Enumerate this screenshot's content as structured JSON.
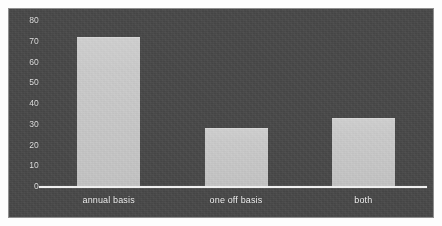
{
  "chart_data": {
    "type": "bar",
    "title": "",
    "subtitle": "",
    "xlabel": "",
    "ylabel": "",
    "categories": [
      "annual basis",
      "one off basis",
      "both"
    ],
    "values": [
      72,
      28,
      33
    ],
    "series": [
      {
        "name": "",
        "values": [
          72,
          28,
          33
        ]
      }
    ],
    "ylim": [
      0,
      80
    ],
    "yticks": [
      80,
      70,
      60,
      50,
      40,
      30,
      20,
      10,
      0
    ],
    "ytick_labels": [
      "80",
      "70",
      "60",
      "50",
      "40",
      "30",
      "20",
      "10",
      "0"
    ],
    "grid": false,
    "legend": false,
    "legend_position": "none",
    "annotations": []
  },
  "style": {
    "panel_background": "#4b4b4b",
    "figure_background": "#fdfdfd",
    "bar_color": "#c9c9c9",
    "axis_line_color": "#f0f0f0",
    "tick_text_color": "#e2e2e2",
    "category_text_color": "#f2f2f2",
    "panel_border_color": "#8e8e8e"
  }
}
